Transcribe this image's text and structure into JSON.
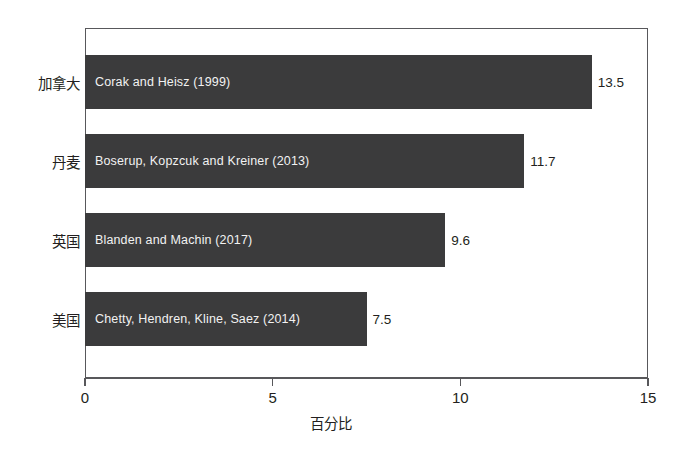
{
  "chart_data": {
    "type": "bar",
    "orientation": "horizontal",
    "title": "",
    "xlabel": "百分比",
    "ylabel": "",
    "xlim": [
      0,
      15
    ],
    "xticks": [
      "0",
      "5",
      "10",
      "15"
    ],
    "xtick_values": [
      0,
      5,
      10,
      15
    ],
    "grid": false,
    "legend": false,
    "bar_color": "#3b3b3c",
    "bar_label_color": "#f2f2f2",
    "axis_color": "#58585b",
    "background": "#ffffff",
    "categories": [
      "加拿大",
      "丹麦",
      "英国",
      "美国"
    ],
    "values": [
      13.5,
      11.7,
      9.6,
      7.5
    ],
    "value_labels": [
      "13.5",
      "11.7",
      "9.6",
      "7.5"
    ],
    "bar_annotations": [
      "Corak and Heisz (1999)",
      "Boserup, Kopzcuk and Kreiner (2013)",
      "Blanden and Machin (2017)",
      "Chetty, Hendren, Kline, Saez (2014)"
    ],
    "bars": [
      {
        "category": "加拿大",
        "value": 13.5,
        "value_label": "13.5",
        "annotation": "Corak and Heisz (1999)"
      },
      {
        "category": "丹麦",
        "value": 11.7,
        "value_label": "11.7",
        "annotation": "Boserup, Kopzcuk and Kreiner (2013)"
      },
      {
        "category": "英国",
        "value": 9.6,
        "value_label": "9.6",
        "annotation": "Blanden and Machin (2017)"
      },
      {
        "category": "美国",
        "value": 7.5,
        "value_label": "7.5",
        "annotation": "Chetty, Hendren, Kline, Saez (2014)"
      }
    ]
  }
}
